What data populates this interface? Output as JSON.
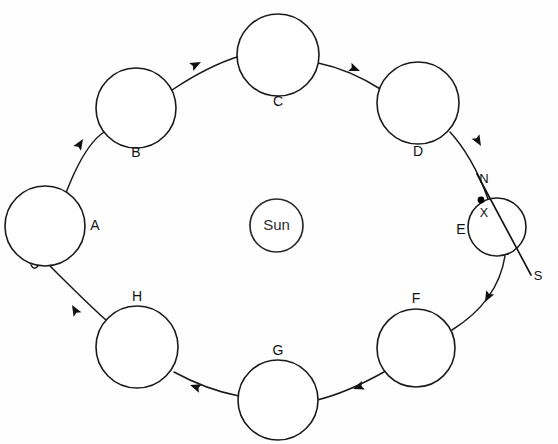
{
  "diagram": {
    "type": "orbit-cycle-diagram",
    "title": "",
    "background_color": "#fefefe",
    "stroke_color": "#1a1a1a",
    "center": {
      "name": "sun",
      "label": "Sun",
      "cx": 276.5,
      "cy": 225.5,
      "r": 26.5
    },
    "orbit": {
      "cx": 270,
      "cy": 226,
      "rx": 232,
      "ry": 187,
      "direction": "counter-clockwise"
    },
    "positions": [
      {
        "id": "A",
        "label": "A",
        "cx": 45,
        "cy": 226,
        "r": 40,
        "label_x": 95,
        "label_y": 226,
        "label_pos": "right"
      },
      {
        "id": "B",
        "label": "B",
        "cx": 136,
        "cy": 108,
        "r": 40,
        "label_x": 136,
        "label_y": 153,
        "label_pos": "below"
      },
      {
        "id": "C",
        "label": "C",
        "cx": 278,
        "cy": 55,
        "r": 41,
        "label_x": 278,
        "label_y": 102,
        "label_pos": "below"
      },
      {
        "id": "D",
        "label": "D",
        "cx": 418,
        "cy": 103,
        "r": 41,
        "label_x": 418,
        "label_y": 152,
        "label_pos": "below"
      },
      {
        "id": "E",
        "label": "E",
        "cx": 497,
        "cy": 227,
        "r": 29,
        "label_x": 461,
        "label_y": 230,
        "label_pos": "left"
      },
      {
        "id": "F",
        "label": "F",
        "cx": 416,
        "cy": 348,
        "r": 39,
        "label_x": 416,
        "label_y": 299,
        "label_pos": "above"
      },
      {
        "id": "G",
        "label": "G",
        "cx": 278,
        "cy": 400,
        "r": 40,
        "label_x": 278,
        "label_y": 351,
        "label_pos": "above"
      },
      {
        "id": "H",
        "label": "H",
        "cx": 137,
        "cy": 347,
        "r": 41,
        "label_x": 137,
        "label_y": 297,
        "label_pos": "above"
      }
    ],
    "axis": {
      "on_position": "E",
      "north_label": "N",
      "south_label": "S",
      "north_x": 484,
      "north_y": 180,
      "south_x": 538,
      "south_y": 277,
      "line_x1": 477,
      "line_y1": 174,
      "line_x2": 531,
      "line_y2": 275
    },
    "marker": {
      "label": "X",
      "dot_x": 481,
      "dot_y": 200,
      "dot_r": 3.4,
      "label_x": 484,
      "label_y": 214
    },
    "arrows": [
      {
        "from": "A",
        "to": "B",
        "tip_x": 83,
        "tip_y": 139,
        "angle": -58
      },
      {
        "from": "B",
        "to": "C",
        "tip_x": 201,
        "tip_y": 62,
        "angle": -27
      },
      {
        "from": "C",
        "to": "D",
        "tip_x": 360,
        "tip_y": 71,
        "angle": 22
      },
      {
        "from": "D",
        "to": "E",
        "tip_x": 481,
        "tip_y": 146,
        "angle": 60
      },
      {
        "from": "E",
        "to": "F",
        "tip_x": 485,
        "tip_y": 302,
        "angle": 118
      },
      {
        "from": "F",
        "to": "G",
        "tip_x": 353,
        "tip_y": 389,
        "angle": 160
      },
      {
        "from": "G",
        "to": "H",
        "tip_x": 190,
        "tip_y": 385,
        "angle": 199
      },
      {
        "from": "H",
        "to": "A",
        "tip_x": 72,
        "tip_y": 305,
        "angle": 240
      }
    ]
  }
}
